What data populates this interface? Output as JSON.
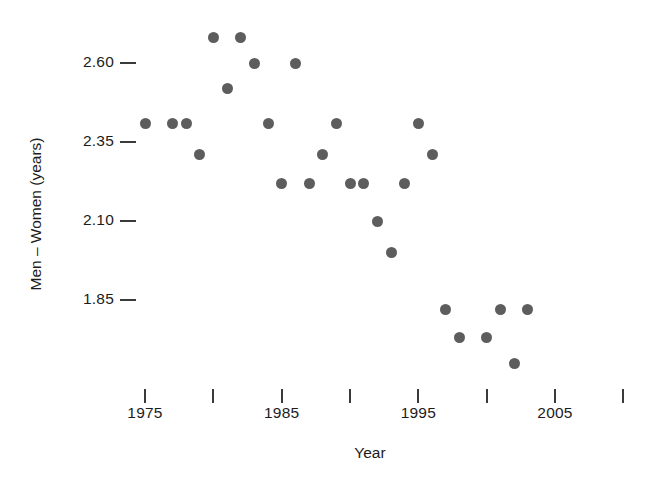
{
  "chart_data": {
    "type": "scatter",
    "title": "",
    "xlabel": "Year",
    "ylabel": "Men – Women (years)",
    "xlim": [
      1973,
      2010.5
    ],
    "ylim": [
      1.72,
      2.72
    ],
    "grid": false,
    "legend": null,
    "xticks": [
      1975,
      1980,
      1985,
      1990,
      1995,
      2000,
      2005,
      2010
    ],
    "xtick_labels": [
      "1975",
      "",
      "1985",
      "",
      "1995",
      "",
      "2005",
      ""
    ],
    "yticks": [
      2.6,
      2.35,
      2.1,
      1.85
    ],
    "ytick_labels": [
      "2.60",
      "2.35",
      "2.10",
      "1.85"
    ],
    "marker": {
      "shape": "circle",
      "color": "#5d5d5d",
      "size_px": 11
    },
    "x": [
      1975,
      1977,
      1978,
      1979,
      1980,
      1981,
      1982,
      1983,
      1984,
      1985,
      1986,
      1987,
      1988,
      1989,
      1990,
      1991,
      1992,
      1993,
      1994,
      1995,
      1996,
      1997,
      1998,
      2000,
      2001,
      2002,
      2003
    ],
    "y": [
      2.41,
      2.41,
      2.41,
      2.31,
      2.68,
      2.52,
      2.68,
      2.6,
      2.41,
      2.22,
      2.6,
      2.22,
      2.31,
      2.41,
      2.22,
      2.22,
      2.1,
      2.0,
      2.22,
      2.41,
      2.31,
      1.82,
      1.73,
      1.73,
      1.82,
      1.65,
      1.82
    ],
    "points": [
      {
        "x": 1975,
        "y": 2.41
      },
      {
        "x": 1977,
        "y": 2.41
      },
      {
        "x": 1978,
        "y": 2.41
      },
      {
        "x": 1979,
        "y": 2.31
      },
      {
        "x": 1980,
        "y": 2.68
      },
      {
        "x": 1981,
        "y": 2.52
      },
      {
        "x": 1982,
        "y": 2.68
      },
      {
        "x": 1983,
        "y": 2.6
      },
      {
        "x": 1984,
        "y": 2.41
      },
      {
        "x": 1985,
        "y": 2.22
      },
      {
        "x": 1986,
        "y": 2.6
      },
      {
        "x": 1987,
        "y": 2.22
      },
      {
        "x": 1988,
        "y": 2.31
      },
      {
        "x": 1989,
        "y": 2.41
      },
      {
        "x": 1990,
        "y": 2.22
      },
      {
        "x": 1991,
        "y": 2.22
      },
      {
        "x": 1992,
        "y": 2.1
      },
      {
        "x": 1993,
        "y": 2.0
      },
      {
        "x": 1994,
        "y": 2.22
      },
      {
        "x": 1995,
        "y": 2.41
      },
      {
        "x": 1996,
        "y": 2.31
      },
      {
        "x": 1997,
        "y": 1.82
      },
      {
        "x": 1998,
        "y": 1.73
      },
      {
        "x": 2000,
        "y": 1.73
      },
      {
        "x": 2001,
        "y": 1.82
      },
      {
        "x": 2002,
        "y": 1.65
      },
      {
        "x": 2003,
        "y": 1.82
      }
    ]
  },
  "axes": {
    "x_title": "Year",
    "y_title": "Men – Women (years)"
  }
}
